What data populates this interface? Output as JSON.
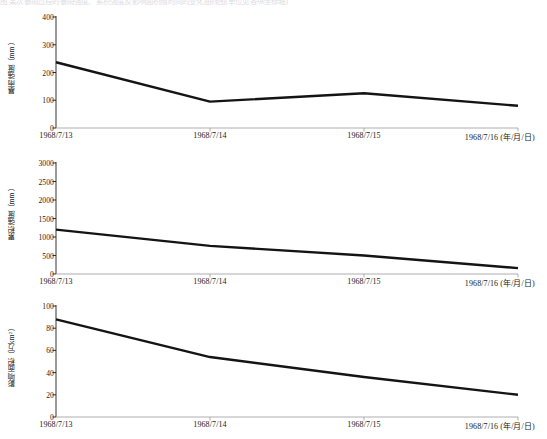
{
  "top_caption": "图  某次暴雨过程的暴雨强度、累积强度及影响面积随时间的变化曲线图(单位见各纵坐标轴)",
  "axis_unit_note": "(年/月/日)",
  "chart_data": [
    {
      "id": "panel-1",
      "type": "line",
      "title": "",
      "ylabel": "暴雨强度（mm）",
      "xlabel": "(年/月/日)",
      "categories": [
        "1968/7/13",
        "1968/7/14",
        "1968/7/15",
        "1968/7/16"
      ],
      "values": [
        237,
        95,
        125,
        80
      ],
      "ylim": [
        0,
        400
      ],
      "yticks": [
        0,
        100,
        200,
        300,
        400
      ],
      "ytick_labels": [
        "0",
        "100",
        "200",
        "300",
        "400"
      ],
      "grid": false,
      "legend": "none",
      "series": [
        {
          "name": "暴雨强度",
          "values": [
            237,
            95,
            125,
            80
          ]
        }
      ]
    },
    {
      "id": "panel-2",
      "type": "line",
      "title": "",
      "ylabel": "累积强度（mm）",
      "xlabel": "(年/月/日)",
      "categories": [
        "1968/7/13",
        "1968/7/14",
        "1968/7/15",
        "1968/7/16"
      ],
      "values": [
        1200,
        760,
        500,
        160
      ],
      "ylim": [
        0,
        3000
      ],
      "yticks": [
        0,
        500,
        1000,
        1500,
        2000,
        2500,
        3000
      ],
      "ytick_labels": [
        "0",
        "500",
        "1000",
        "1500",
        "2000",
        "2500",
        "3000"
      ],
      "grid": false,
      "legend": "none",
      "series": [
        {
          "name": "累积强度",
          "values": [
            1200,
            760,
            500,
            160
          ]
        }
      ]
    },
    {
      "id": "panel-3",
      "type": "line",
      "title": "",
      "ylabel": "影响面积（万km²）",
      "xlabel": "(年/月/日)",
      "categories": [
        "1968/7/13",
        "1968/7/14",
        "1968/7/15",
        "1968/7/16"
      ],
      "values": [
        88,
        54,
        36,
        20
      ],
      "ylim": [
        0,
        100
      ],
      "yticks": [
        0,
        20,
        40,
        60,
        80,
        100
      ],
      "ytick_labels": [
        "0",
        "20",
        "40",
        "60",
        "80",
        "100"
      ],
      "grid": false,
      "legend": "none",
      "series": [
        {
          "name": "影响面积",
          "values": [
            88,
            54,
            36,
            20
          ]
        }
      ]
    }
  ]
}
